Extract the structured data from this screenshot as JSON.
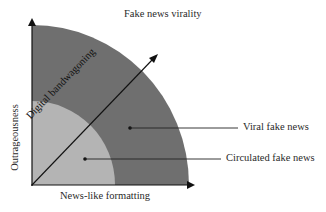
{
  "title": "Fake news virality",
  "axes": {
    "x_label": "News-like formatting",
    "y_label": "Outrageousness",
    "diagonal_label": "Digital bandwagoning"
  },
  "regions": [
    {
      "name": "Viral fake news",
      "color": "#6f6f6f"
    },
    {
      "name": "Circulated fake news",
      "color": "#b4b4b4"
    }
  ],
  "labels": {
    "viral": "Viral fake news",
    "circulated": "Circulated fake news"
  }
}
